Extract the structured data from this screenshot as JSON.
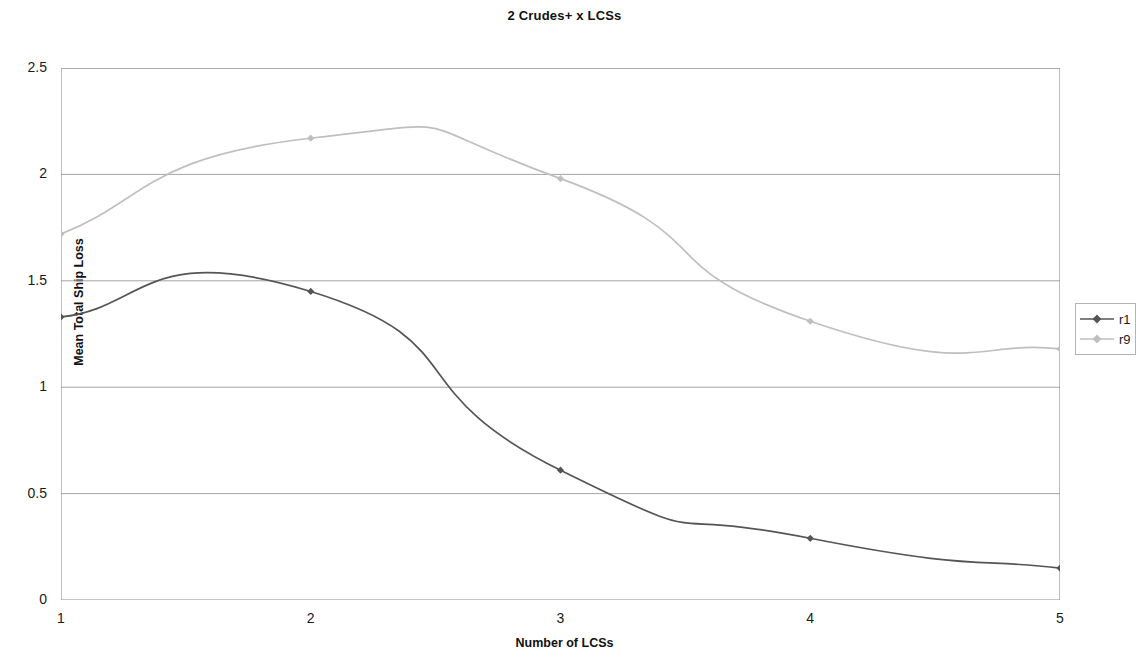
{
  "chart_data": {
    "type": "line",
    "title": "2 Crudes+ x LCSs",
    "xlabel": "Number of LCSs",
    "ylabel": "Mean Total Ship Loss",
    "x": [
      1,
      2,
      3,
      4,
      5
    ],
    "xlim": [
      1,
      5
    ],
    "ylim": [
      0,
      2.5
    ],
    "ytick_labels": [
      "0",
      "0.5",
      "1",
      "1.5",
      "2",
      "2.5"
    ],
    "ytick_values": [
      0,
      0.5,
      1,
      1.5,
      2,
      2.5
    ],
    "xtick_labels": [
      "1",
      "2",
      "3",
      "4",
      "5"
    ],
    "grid": "horizontal",
    "legend_position": "right",
    "smoothed": true,
    "series": [
      {
        "name": "r1",
        "color": "#555555",
        "marker": "diamond",
        "values": [
          1.33,
          1.45,
          0.61,
          0.29,
          0.15
        ]
      },
      {
        "name": "r9",
        "color": "#bfbfbf",
        "marker": "diamond",
        "values": [
          1.72,
          2.17,
          1.98,
          1.31,
          1.18
        ]
      }
    ]
  },
  "legend": {
    "entries": [
      {
        "label": "r1"
      },
      {
        "label": "r9"
      }
    ]
  },
  "colors": {
    "series_r1": "#555555",
    "series_r9": "#bfbfbf",
    "gridline": "#9a9a9a",
    "axis": "#8c8c8c",
    "text": "#1a1a1a"
  }
}
